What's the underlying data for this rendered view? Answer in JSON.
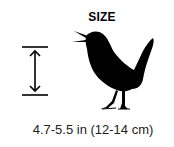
{
  "figure": {
    "title": "SIZE",
    "caption": "4.7-5.5 in (12-14 cm)",
    "icons": [
      "height-arrow-icon",
      "bird-silhouette-icon"
    ],
    "colors": {
      "silhouette": "#000000",
      "text": "#222222",
      "background": "#ffffff"
    }
  }
}
